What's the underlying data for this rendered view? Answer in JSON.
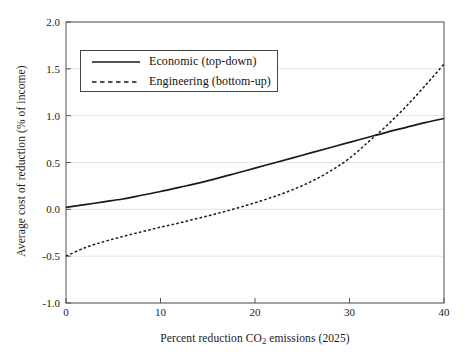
{
  "chart_data": {
    "type": "line",
    "title": "",
    "xlabel": "Percent reduction CO2 emissions (2025)",
    "xlabel_prefix": "Percent reduction CO",
    "xlabel_subscript": "2",
    "xlabel_suffix": " emissions (2025)",
    "ylabel": "Average cost of reduction (% of income)",
    "xlim": [
      0,
      40
    ],
    "ylim": [
      -1.0,
      2.0
    ],
    "xticks": [
      "0",
      "10",
      "20",
      "30",
      "40"
    ],
    "xtick_values": [
      0,
      10,
      20,
      30,
      40
    ],
    "yticks": [
      "2.0",
      "1.5",
      "1.0",
      "0.5",
      "0.0",
      "-0.5",
      "-1.0"
    ],
    "ytick_values": [
      2.0,
      1.5,
      1.0,
      0.5,
      0.0,
      -0.5,
      -1.0
    ],
    "grid": true,
    "grid_axis": "y",
    "legend_position": "upper left",
    "x": [
      0,
      2,
      4,
      6,
      8,
      10,
      12,
      14,
      16,
      18,
      20,
      22,
      24,
      26,
      28,
      30,
      32,
      34,
      36,
      38,
      40
    ],
    "series": [
      {
        "name": "Economic (top-down)",
        "style": "solid",
        "color": "#1a1a1a",
        "values": [
          0.02,
          0.05,
          0.08,
          0.11,
          0.15,
          0.19,
          0.235,
          0.28,
          0.33,
          0.385,
          0.44,
          0.495,
          0.55,
          0.605,
          0.66,
          0.715,
          0.77,
          0.825,
          0.875,
          0.925,
          0.97
        ]
      },
      {
        "name": "Engineering (bottom-up)",
        "style": "dashed",
        "color": "#1a1a1a",
        "values": [
          -0.5,
          -0.41,
          -0.345,
          -0.29,
          -0.24,
          -0.19,
          -0.145,
          -0.095,
          -0.045,
          0.01,
          0.07,
          0.135,
          0.21,
          0.3,
          0.41,
          0.545,
          0.72,
          0.9,
          1.1,
          1.32,
          1.55
        ]
      }
    ],
    "crossing_point": {
      "x": 31,
      "y": 0.65
    },
    "axis_color": "#555555",
    "grid_color": "#e3e3e3",
    "background": "#ffffff"
  },
  "legend": {
    "items": [
      {
        "label": "Economic (top-down)",
        "style": "solid"
      },
      {
        "label": "Engineering (bottom-up)",
        "style": "dashed"
      }
    ]
  }
}
